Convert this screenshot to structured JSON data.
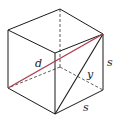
{
  "diagram": {
    "type": "cube-diagonal",
    "labels": {
      "diagonal": "d",
      "face_diagonal": "y",
      "edge_right": "s",
      "edge_bottom": "s"
    },
    "colors": {
      "edge": "#1a1a1a",
      "hidden_edge": "#333333",
      "diagonal": "#b03a4e",
      "background": "#ffffff"
    }
  }
}
